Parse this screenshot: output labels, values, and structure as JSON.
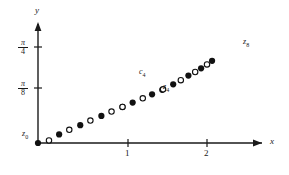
{
  "figure": {
    "background_color": "#ffffff",
    "ink_color": "#1a1a1a"
  },
  "axes": {
    "x_axis_label": "x",
    "y_axis_label": "y",
    "x_ticks": [
      {
        "label": "1",
        "value": 1
      },
      {
        "label": "2",
        "value": 2
      }
    ],
    "y_ticks": [
      {
        "numerator": "π",
        "denominator": "8",
        "value": 0.3927
      },
      {
        "numerator": "π",
        "denominator": "4",
        "value": 0.7854
      }
    ]
  },
  "annotations": [
    {
      "text": "z",
      "sub": "0",
      "name": "label-z0"
    },
    {
      "text": "c",
      "sub": "4",
      "name": "label-c4"
    },
    {
      "text": "z",
      "sub": "4",
      "name": "label-z4"
    },
    {
      "text": "z",
      "sub": "8",
      "name": "label-z8"
    }
  ],
  "chart_data": {
    "type": "scatter",
    "title": "",
    "xlabel": "x",
    "ylabel": "y",
    "xlim": [
      0,
      2.55
    ],
    "ylim": [
      0,
      0.98
    ],
    "grid": false,
    "legend": null,
    "series": [
      {
        "name": "z_n (filled markers)",
        "marker": "filled-circle",
        "color": "#111111",
        "points": [
          {
            "x": 0.0,
            "y": 0.0,
            "label": "z0"
          },
          {
            "x": 0.25,
            "y": 0.0706,
            "label": "z1"
          },
          {
            "x": 0.5,
            "y": 0.1458,
            "label": "z2"
          },
          {
            "x": 0.75,
            "y": 0.2219,
            "label": "z3"
          },
          {
            "x": 1.0,
            "y": 0.2958,
            "label": "z4"
          },
          {
            "x": 1.12,
            "y": 0.3316,
            "label": ""
          },
          {
            "x": 1.35,
            "y": 0.3993,
            "label": "z4"
          },
          {
            "x": 1.47,
            "y": 0.4356,
            "label": ""
          },
          {
            "x": 1.6,
            "y": 0.4806,
            "label": ""
          },
          {
            "x": 1.78,
            "y": 0.5527,
            "label": ""
          },
          {
            "x": 1.93,
            "y": 0.6122,
            "label": ""
          },
          {
            "x": 2.06,
            "y": 0.6739,
            "label": "z8"
          }
        ]
      },
      {
        "name": "c_n (open markers)",
        "marker": "open-circle",
        "color": "#111111",
        "points": [
          {
            "x": 0.13,
            "y": 0.0215,
            "label": ""
          },
          {
            "x": 0.37,
            "y": 0.1084,
            "label": ""
          },
          {
            "x": 0.62,
            "y": 0.1836,
            "label": ""
          },
          {
            "x": 0.87,
            "y": 0.2576,
            "label": ""
          },
          {
            "x": 1.0,
            "y": 0.2958,
            "label": ""
          },
          {
            "x": 1.24,
            "y": 0.3659,
            "label": "c4"
          },
          {
            "x": 1.48,
            "y": 0.4398,
            "label": ""
          },
          {
            "x": 1.69,
            "y": 0.515,
            "label": ""
          },
          {
            "x": 1.86,
            "y": 0.5818,
            "label": ""
          },
          {
            "x": 2.0,
            "y": 0.644,
            "label": ""
          }
        ]
      }
    ]
  }
}
